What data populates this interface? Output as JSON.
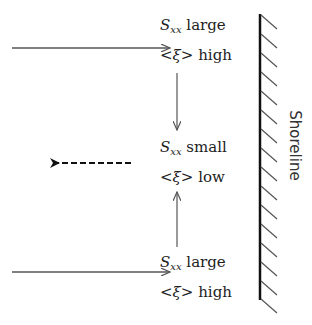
{
  "diagram": {
    "blocks": [
      {
        "symbol": "S",
        "subscript": "xx",
        "sxx_state": "large",
        "xi_label": "<ξ>",
        "xi_state": "high",
        "position": "top"
      },
      {
        "symbol": "S",
        "subscript": "xx",
        "sxx_state": "small",
        "xi_label": "<ξ>",
        "xi_state": "low",
        "position": "middle"
      },
      {
        "symbol": "S",
        "subscript": "xx",
        "sxx_state": "large",
        "xi_label": "<ξ>",
        "xi_state": "high",
        "position": "bottom"
      }
    ],
    "shoreline_label": "Shoreline",
    "arrows": [
      {
        "name": "incoming-top",
        "style": "solid",
        "direction": "right"
      },
      {
        "name": "incoming-bottom",
        "style": "solid",
        "direction": "right"
      },
      {
        "name": "convergence-down",
        "style": "solid",
        "direction": "down"
      },
      {
        "name": "convergence-up",
        "style": "solid",
        "direction": "up"
      },
      {
        "name": "rip-current",
        "style": "dashed",
        "direction": "left"
      }
    ],
    "colors": {
      "stroke": "#555555",
      "shoreline": "#111111",
      "text": "#222222"
    }
  }
}
